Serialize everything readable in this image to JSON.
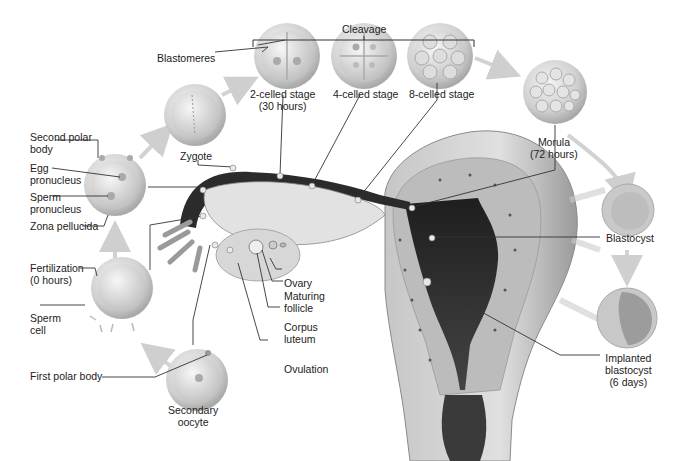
{
  "cleavage_bracket": {
    "label": "Cleavage"
  },
  "stages": [
    {
      "id": "secondary-oocyte",
      "label": "Secondary\noocyte"
    },
    {
      "id": "fertilization",
      "label": "Fertilization\n(0 hours)"
    },
    {
      "id": "pronuclei",
      "label": ""
    },
    {
      "id": "zygote",
      "label": "Zygote"
    },
    {
      "id": "2-cell",
      "label": "2-celled stage\n(30 hours)"
    },
    {
      "id": "4-cell",
      "label": "4-celled stage"
    },
    {
      "id": "8-cell",
      "label": "8-celled stage"
    },
    {
      "id": "morula",
      "label": "Morula\n(72 hours)"
    },
    {
      "id": "blastocyst",
      "label": "Blastocyst"
    },
    {
      "id": "implanted-blastocyst",
      "label": "Implanted\nblastocyst\n(6 days)"
    }
  ],
  "labels": {
    "blastomeres": "Blastomeres",
    "second_polar_body": "Second polar\nbody",
    "egg_pronucleus": "Egg\npronucleus",
    "sperm_pronucleus": "Sperm\npronucleus",
    "zona_pellucida": "Zona pellucida",
    "fertilization": "Fertilization\n(0 hours)",
    "sperm_cell": "Sperm\ncell",
    "first_polar_body": "First polar body",
    "secondary_oocyte": "Secondary\noocyte",
    "zygote": "Zygote",
    "two_cell": "2-celled stage\n(30 hours)",
    "four_cell": "4-celled stage",
    "eight_cell": "8-celled stage",
    "cleavage": "Cleavage",
    "morula": "Morula\n(72 hours)",
    "blastocyst": "Blastocyst",
    "implanted_blastocyst": "Implanted\nblastocyst\n(6 days)",
    "ovary": "Ovary",
    "maturing_follicle": "Maturing\nfollicle",
    "corpus_luteum": "Corpus\nluteum",
    "ovulation": "Ovulation"
  },
  "colors": {
    "cell_fill": "#d9d9d9",
    "cell_rim": "#bdbdbd",
    "arrow": "#cfcfcf",
    "tube_dark": "#2b2b2b",
    "uterus_wall": "#b8b8b8",
    "leader_line": "#333333"
  }
}
